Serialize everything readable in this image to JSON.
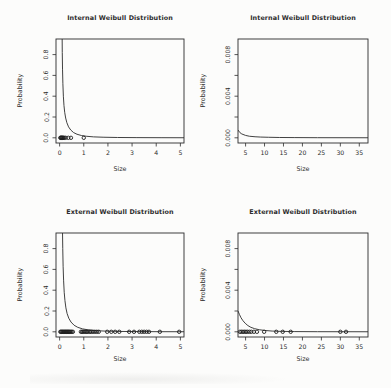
{
  "page": {
    "background": "#fcfcfb",
    "text_color": "#2c2c2c",
    "line_color": "#2b2b2b",
    "point_color": "#1e1e1e"
  },
  "chart_data": [
    {
      "id": "internal-overview",
      "type": "line",
      "title": "Internal Weibull Distribution",
      "xlabel": "Size",
      "ylabel": "Probability",
      "xlim": [
        -0.15,
        5.15
      ],
      "ylim": [
        -0.05,
        0.95
      ],
      "grid": false,
      "legend": "none",
      "xticks": {
        "values": [
          0,
          1,
          2,
          3,
          4,
          5
        ],
        "labels": [
          "0",
          "1",
          "2",
          "3",
          "4",
          "5"
        ]
      },
      "yticks": {
        "values": [
          0,
          0.2,
          0.4,
          0.6,
          0.8
        ],
        "labels": [
          "0.0",
          "0.2",
          "0.4",
          "0.6",
          "0.8"
        ]
      },
      "curve": [
        [
          0.105,
          0.95
        ],
        [
          0.11,
          0.82
        ],
        [
          0.12,
          0.66
        ],
        [
          0.135,
          0.52
        ],
        [
          0.155,
          0.4
        ],
        [
          0.18,
          0.31
        ],
        [
          0.21,
          0.245
        ],
        [
          0.25,
          0.19
        ],
        [
          0.3,
          0.145
        ],
        [
          0.37,
          0.105
        ],
        [
          0.46,
          0.075
        ],
        [
          0.58,
          0.05
        ],
        [
          0.72,
          0.034
        ],
        [
          0.9,
          0.022
        ],
        [
          1.1,
          0.015
        ],
        [
          1.4,
          0.009
        ],
        [
          1.8,
          0.0055
        ],
        [
          2.4,
          0.003
        ],
        [
          3.2,
          0.0017
        ],
        [
          4.2,
          0.001
        ],
        [
          5.15,
          0.0006
        ]
      ],
      "points_x": [
        0.03,
        0.05,
        0.07,
        0.09,
        0.11,
        0.13,
        0.16,
        0.19,
        0.25,
        0.36,
        0.47,
        1.0
      ],
      "points_y": 0
    },
    {
      "id": "internal-zoom",
      "type": "line",
      "title": "Internal Weibull Distribution",
      "xlabel": "Size",
      "ylabel": "Probability",
      "xlim": [
        3.0,
        37.3
      ],
      "ylim": [
        -0.0005,
        0.0095
      ],
      "grid": false,
      "legend": "none",
      "xticks": {
        "values": [
          5,
          10,
          15,
          20,
          25,
          30,
          35
        ],
        "labels": [
          "5",
          "10",
          "15",
          "20",
          "25",
          "30",
          "35"
        ]
      },
      "yticks": {
        "values": [
          0,
          0.002,
          0.004,
          0.006,
          0.008
        ],
        "labels": [
          "0.000",
          "",
          "0.004",
          "",
          "0.008"
        ]
      },
      "curve": [
        [
          3.0,
          0.00075
        ],
        [
          3.5,
          0.0005
        ],
        [
          4.0,
          0.00037
        ],
        [
          5.0,
          0.00023
        ],
        [
          6.0,
          0.00015
        ],
        [
          7.5,
          0.0001
        ],
        [
          9.0,
          7e-05
        ],
        [
          11.0,
          5e-05
        ],
        [
          14.0,
          3e-05
        ],
        [
          18.0,
          2e-05
        ],
        [
          24.0,
          1e-05
        ],
        [
          37.3,
          5e-06
        ]
      ],
      "points_x": [],
      "points_y": 0
    },
    {
      "id": "external-overview",
      "type": "line",
      "title": "External Weibull Distribution",
      "xlabel": "Size",
      "ylabel": "Probability",
      "xlim": [
        -0.15,
        5.15
      ],
      "ylim": [
        -0.05,
        0.95
      ],
      "grid": false,
      "legend": "none",
      "xticks": {
        "values": [
          0,
          1,
          2,
          3,
          4,
          5
        ],
        "labels": [
          "0",
          "1",
          "2",
          "3",
          "4",
          "5"
        ]
      },
      "yticks": {
        "values": [
          0,
          0.2,
          0.4,
          0.6,
          0.8
        ],
        "labels": [
          "0.0",
          "0.2",
          "0.4",
          "0.6",
          "0.8"
        ]
      },
      "curve": [
        [
          0.12,
          0.95
        ],
        [
          0.13,
          0.8
        ],
        [
          0.145,
          0.63
        ],
        [
          0.165,
          0.49
        ],
        [
          0.19,
          0.38
        ],
        [
          0.22,
          0.3
        ],
        [
          0.26,
          0.23
        ],
        [
          0.31,
          0.175
        ],
        [
          0.38,
          0.13
        ],
        [
          0.47,
          0.094
        ],
        [
          0.6,
          0.063
        ],
        [
          0.75,
          0.043
        ],
        [
          0.95,
          0.028
        ],
        [
          1.2,
          0.018
        ],
        [
          1.5,
          0.011
        ],
        [
          1.9,
          0.0065
        ],
        [
          2.5,
          0.0035
        ],
        [
          3.3,
          0.002
        ],
        [
          4.2,
          0.0011
        ],
        [
          5.15,
          0.0007
        ]
      ],
      "points_x": [
        0.03,
        0.06,
        0.09,
        0.12,
        0.15,
        0.18,
        0.21,
        0.24,
        0.27,
        0.3,
        0.33,
        0.36,
        0.39,
        0.42,
        0.46,
        0.5,
        0.55,
        0.88,
        0.93,
        0.98,
        1.03,
        1.08,
        1.13,
        1.19,
        1.25,
        1.31,
        1.38,
        1.46,
        1.54,
        1.62,
        1.97,
        2.14,
        2.3,
        2.47,
        2.88,
        3.08,
        3.3,
        3.4,
        3.5,
        3.6,
        3.7,
        4.15,
        4.95
      ],
      "points_y": 0
    },
    {
      "id": "external-zoom",
      "type": "line",
      "title": "External Weibull Distribution",
      "xlabel": "Size",
      "ylabel": "Probability",
      "xlim": [
        3.0,
        37.3
      ],
      "ylim": [
        -0.0005,
        0.0095
      ],
      "grid": false,
      "legend": "none",
      "xticks": {
        "values": [
          5,
          10,
          15,
          20,
          25,
          30,
          35
        ],
        "labels": [
          "5",
          "10",
          "15",
          "20",
          "25",
          "30",
          "35"
        ]
      },
      "yticks": {
        "values": [
          0,
          0.002,
          0.004,
          0.006,
          0.008
        ],
        "labels": [
          "0.000",
          "",
          "0.004",
          "",
          "0.008"
        ]
      },
      "curve": [
        [
          3.0,
          0.002
        ],
        [
          3.4,
          0.00165
        ],
        [
          3.8,
          0.00135
        ],
        [
          4.3,
          0.00107
        ],
        [
          4.9,
          0.00082
        ],
        [
          5.6,
          0.0006
        ],
        [
          6.4,
          0.00043
        ],
        [
          7.4,
          0.0003
        ],
        [
          8.6,
          0.0002
        ],
        [
          10.0,
          0.00013
        ],
        [
          12.0,
          7e-05
        ],
        [
          14.5,
          4e-05
        ],
        [
          18.0,
          2e-05
        ],
        [
          24.0,
          1e-05
        ],
        [
          37.3,
          4e-06
        ]
      ],
      "points_x": [
        3.5,
        3.9,
        4.3,
        4.7,
        5.1,
        5.5,
        6.0,
        6.5,
        7.2,
        8.0,
        9.9,
        13.1,
        14.8,
        16.9,
        30.0,
        31.5
      ],
      "points_y": 0
    }
  ]
}
